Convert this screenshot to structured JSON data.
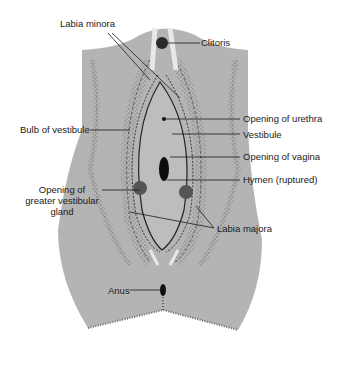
{
  "diagram": {
    "type": "anatomical",
    "colors": {
      "body_fill": "#b4b4b4",
      "stipple": "#555555",
      "dark_feature": "#111111",
      "highlight": "#e8e8e8",
      "line": "#1a1a1a"
    },
    "labels": {
      "labia_minora": "Labia minora",
      "clitoris": "Clitoris",
      "opening_of_urethra": "Opening of urethra",
      "bulb_of_vestibule": "Bulb of vestibule",
      "vestibule": "Vestibule",
      "opening_of_vagina": "Opening of vagina",
      "hymen": "Hymen (ruptured)",
      "greater_gland_line1": "Opening of",
      "greater_gland_line2": "greater vestibular",
      "greater_gland_line3": "gland",
      "labia_majora": "Labia majora",
      "anus": "Anus"
    }
  }
}
